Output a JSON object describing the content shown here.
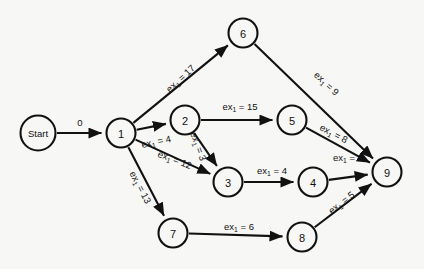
{
  "diagram": {
    "background_color": "#f7f7f5",
    "stroke_color": "#111111",
    "nodes": [
      {
        "id": "start",
        "label": "Start",
        "x": 38,
        "y": 133,
        "r": 17.5,
        "type": "terminal"
      },
      {
        "id": "n1",
        "label": "1",
        "x": 121,
        "y": 133,
        "r": 14.5,
        "type": "event"
      },
      {
        "id": "n2",
        "label": "2",
        "x": 185,
        "y": 120,
        "r": 14.5,
        "type": "event"
      },
      {
        "id": "n3",
        "label": "3",
        "x": 228,
        "y": 182,
        "r": 14.5,
        "type": "event"
      },
      {
        "id": "n4",
        "label": "4",
        "x": 313,
        "y": 182,
        "r": 14.5,
        "type": "event"
      },
      {
        "id": "n5",
        "label": "5",
        "x": 292,
        "y": 120,
        "r": 14.5,
        "type": "event"
      },
      {
        "id": "n6",
        "label": "6",
        "x": 243,
        "y": 33,
        "r": 14.5,
        "type": "event"
      },
      {
        "id": "n7",
        "label": "7",
        "x": 173,
        "y": 233,
        "r": 14.5,
        "type": "event"
      },
      {
        "id": "n8",
        "label": "8",
        "x": 302,
        "y": 237,
        "r": 14.5,
        "type": "event"
      },
      {
        "id": "n9",
        "label": "9",
        "x": 387,
        "y": 172,
        "r": 14.5,
        "type": "event"
      }
    ],
    "edges": [
      {
        "id": "e-start-1",
        "from": "start",
        "to": "n1",
        "prefix": "",
        "sub": "",
        "value": "0",
        "label_text": "0",
        "label_x": 80,
        "label_y": 122,
        "rotate": 0
      },
      {
        "id": "e-1-6",
        "from": "n1",
        "to": "n6",
        "prefix": "ex",
        "sub": "1",
        "value": "17",
        "label_text": "ex₁ = 17",
        "label_x": 180,
        "label_y": 78,
        "rotate": -43
      },
      {
        "id": "e-1-2",
        "from": "n1",
        "to": "n2",
        "prefix": "ex",
        "sub": "1",
        "value": "4",
        "label_text": "ex₁ = 4",
        "label_x": 156,
        "label_y": 141,
        "rotate": -12
      },
      {
        "id": "e-1-3",
        "from": "n1",
        "to": "n3",
        "prefix": "ex",
        "sub": "1",
        "value": "12",
        "label_text": "ex₁ = 12",
        "label_x": 175,
        "label_y": 159,
        "rotate": 21
      },
      {
        "id": "e-1-7",
        "from": "n1",
        "to": "n7",
        "prefix": "ex",
        "sub": "1",
        "value": "13",
        "label_text": "ex₁ = 13",
        "label_x": 141,
        "label_y": 187,
        "rotate": 62
      },
      {
        "id": "e-2-5",
        "from": "n2",
        "to": "n5",
        "prefix": "ex",
        "sub": "1",
        "value": "15",
        "label_text": "ex₁ = 15",
        "label_x": 240,
        "label_y": 106,
        "rotate": 0
      },
      {
        "id": "e-2-3",
        "from": "n2",
        "to": "n3",
        "prefix": "ex",
        "sub": "1",
        "value": "3",
        "label_text": "ex₁ = 3",
        "label_x": 199,
        "label_y": 146,
        "rotate": 70
      },
      {
        "id": "e-3-4",
        "from": "n3",
        "to": "n4",
        "prefix": "ex",
        "sub": "1",
        "value": "4",
        "label_text": "ex₁ = 4",
        "label_x": 272,
        "label_y": 170,
        "rotate": 0
      },
      {
        "id": "e-5-9",
        "from": "n5",
        "to": "n9",
        "prefix": "ex",
        "sub": "1",
        "value": "8",
        "label_text": "ex₁ = 8",
        "label_x": 334,
        "label_y": 133,
        "rotate": 28
      },
      {
        "id": "e-6-9",
        "from": "n6",
        "to": "n9",
        "prefix": "ex",
        "sub": "1",
        "value": "9",
        "label_text": "ex₁ = 9",
        "label_x": 327,
        "label_y": 83,
        "rotate": 43
      },
      {
        "id": "e-4-9",
        "from": "n4",
        "to": "n9",
        "prefix": "ex",
        "sub": "1",
        "value": "2",
        "label_text": "ex₁ = 2",
        "label_x": 348,
        "label_y": 157,
        "rotate": 0
      },
      {
        "id": "e-7-8",
        "from": "n7",
        "to": "n8",
        "prefix": "ex",
        "sub": "1",
        "value": "6",
        "label_text": "ex₁ = 6",
        "label_x": 239,
        "label_y": 226,
        "rotate": 0
      },
      {
        "id": "e-8-9",
        "from": "n8",
        "to": "n9",
        "prefix": "ex",
        "sub": "1",
        "value": "5",
        "label_text": "ex₁ = 5",
        "label_x": 341,
        "label_y": 202,
        "rotate": -38
      }
    ]
  }
}
